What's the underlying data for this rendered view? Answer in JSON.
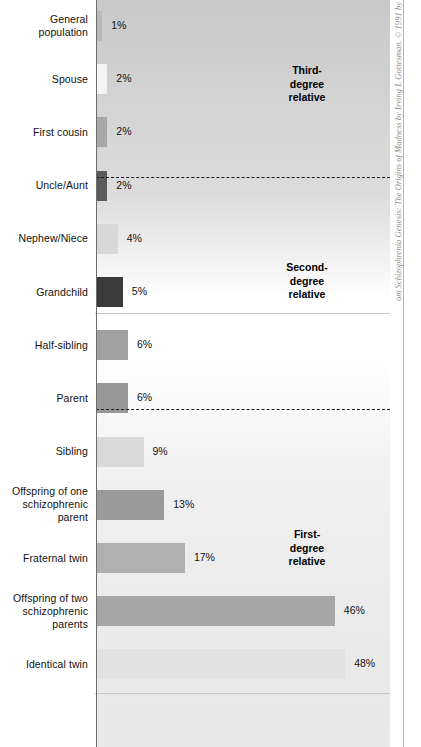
{
  "chart_data": {
    "type": "bar",
    "orientation": "horizontal",
    "title": "",
    "subtitle": "",
    "xlabel": "",
    "ylabel": "",
    "xlim": [
      0,
      55
    ],
    "grid": false,
    "legend": "none",
    "value_suffix": "%",
    "categories": [
      "General population",
      "Spouse",
      "First cousin",
      "Uncle/Aunt",
      "Nephew/Niece",
      "Grandchild",
      "Half-sibling",
      "Parent",
      "Sibling",
      "Offspring of one schizophrenic parent",
      "Fraternal twin",
      "Offspring of two schizophrenic parents",
      "Identical twin"
    ],
    "values": [
      1,
      2,
      2,
      2,
      4,
      5,
      6,
      6,
      9,
      13,
      17,
      46,
      48
    ],
    "value_labels": [
      "1%",
      "2%",
      "2%",
      "2%",
      "4%",
      "5%",
      "6%",
      "6%",
      "9%",
      "13%",
      "17%",
      "46%",
      "48%"
    ],
    "bar_colors": [
      "#b9b9b9",
      "#f4f4f4",
      "#a8a8a8",
      "#5b5b5b",
      "#d8d8d8",
      "#3b3b3b",
      "#a0a0a0",
      "#979797",
      "#d9d9d9",
      "#9a9a9a",
      "#b0b0b0",
      "#a6a6a6",
      "#e2e2e2"
    ],
    "groups": [
      {
        "label": "Third-\ndegree\nrelative",
        "members": [
          "General population",
          "Spouse",
          "First cousin"
        ]
      },
      {
        "label": "Second-\ndegree\nrelative",
        "members": [
          "Uncle/Aunt",
          "Nephew/Niece",
          "Grandchild",
          "Half-sibling"
        ]
      },
      {
        "label": "First-\ndegree\nrelative",
        "members": [
          "Parent",
          "Sibling",
          "Offspring of one schizophrenic parent",
          "Fraternal twin",
          "Offspring of two schizophrenic parents",
          "Identical twin"
        ]
      }
    ]
  },
  "rows": [
    {
      "label": "General\npopulation",
      "value": 1,
      "value_label": "1%",
      "color": "#b9b9b9"
    },
    {
      "label": "Spouse",
      "value": 2,
      "value_label": "2%",
      "color": "#f4f4f4"
    },
    {
      "label": "First cousin",
      "value": 2,
      "value_label": "2%",
      "color": "#a8a8a8"
    },
    {
      "label": "Uncle/Aunt",
      "value": 2,
      "value_label": "2%",
      "color": "#5b5b5b"
    },
    {
      "label": "Nephew/Niece",
      "value": 4,
      "value_label": "4%",
      "color": "#d8d8d8"
    },
    {
      "label": "Grandchild",
      "value": 5,
      "value_label": "5%",
      "color": "#3b3b3b"
    },
    {
      "label": "Half-sibling",
      "value": 6,
      "value_label": "6%",
      "color": "#a0a0a0"
    },
    {
      "label": "Parent",
      "value": 6,
      "value_label": "6%",
      "color": "#979797"
    },
    {
      "label": "Sibling",
      "value": 9,
      "value_label": "9%",
      "color": "#d9d9d9"
    },
    {
      "label": "Offspring of one\nschizophrenic\nparent",
      "value": 13,
      "value_label": "13%",
      "color": "#9a9a9a"
    },
    {
      "label": "Fraternal twin",
      "value": 17,
      "value_label": "17%",
      "color": "#b0b0b0"
    },
    {
      "label": "Offspring of two\nschizophrenic\nparents",
      "value": 46,
      "value_label": "46%",
      "color": "#a6a6a6"
    },
    {
      "label": "Identical twin",
      "value": 48,
      "value_label": "48%",
      "color": "#e2e2e2"
    }
  ],
  "group_labels": [
    {
      "text": "Third-\ndegree\nrelative"
    },
    {
      "text": "Second-\ndegree\nrelative"
    },
    {
      "text": "First-\ndegree\nrelative"
    }
  ],
  "credit": {
    "text": "om Schizophrenia Genesis: The Origins of Madness by Irving I. Gottesman. © 1991 by"
  }
}
